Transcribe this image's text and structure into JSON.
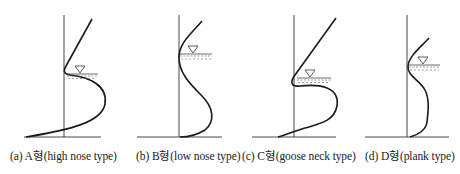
{
  "figure": {
    "stroke_color": "#222222",
    "panels": [
      {
        "id": "a",
        "caption": "(a) A형(high nose type)",
        "label": "A형",
        "type_name": "high nose type",
        "water_level_symbol": "inverted-triangle"
      },
      {
        "id": "b",
        "caption": "(b) B형(low nose type)",
        "label": "B형",
        "type_name": "low nose type",
        "water_level_symbol": "inverted-triangle"
      },
      {
        "id": "c",
        "caption": "(c) C형(goose neck type)",
        "label": "C형",
        "type_name": "goose neck type",
        "water_level_symbol": "inverted-triangle"
      },
      {
        "id": "d",
        "caption": "(d) D형(plank type)",
        "label": "D형",
        "type_name": "plank type",
        "water_level_symbol": "inverted-triangle"
      }
    ]
  }
}
